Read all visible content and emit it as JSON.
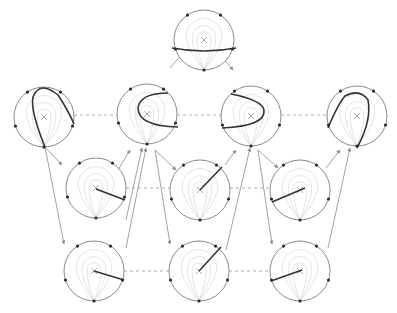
{
  "diagram": {
    "title": "",
    "width": 397,
    "height": 313,
    "colors": {
      "circle": "#8a8a8a",
      "inner": "#d8d8d8",
      "curve": "#333333",
      "dot": "#2a2a2a",
      "arrow": "#8a8a8a",
      "dashed": "#9a9a9a",
      "center": "#9a9a9a"
    },
    "radius": 30,
    "nodes": [
      {
        "id": "top",
        "cx": 204,
        "cy": 40,
        "curve": "M 172 48 Q 204 54 236 48"
      },
      {
        "id": "r1a",
        "cx": 44,
        "cy": 117,
        "curve": "M 45 147 Q 30 110 33 97 Q 40 80 58 95 Q 68 110 74 124"
      },
      {
        "id": "r1b",
        "cx": 147,
        "cy": 114,
        "curve": "M 168 93 Q 140 93 138 108 Q 138 126 178 127"
      },
      {
        "id": "r1c",
        "cx": 251,
        "cy": 116,
        "curve": "M 231 94 Q 262 100 264 110 Q 266 126 222 128"
      },
      {
        "id": "r1d",
        "cx": 357,
        "cy": 116,
        "curve": "M 328 128 Q 338 104 345 96 Q 360 88 368 100 Q 372 120 357 148"
      },
      {
        "id": "r2a",
        "cx": 96,
        "cy": 188,
        "curve": "M 96 189 L 125 200"
      },
      {
        "id": "r2b",
        "cx": 200,
        "cy": 190,
        "curve": "M 200 190 L 222 167"
      },
      {
        "id": "r2c",
        "cx": 300,
        "cy": 190,
        "curve": "M 305 188 L 272 202"
      },
      {
        "id": "r3a",
        "cx": 94,
        "cy": 271,
        "curve": "M 94 271 L 124 280"
      },
      {
        "id": "r3b",
        "cx": 199,
        "cy": 271,
        "curve": "M 199 271 L 221 247"
      },
      {
        "id": "r3c",
        "cx": 300,
        "cy": 271,
        "curve": "M 302 270 L 271 281"
      }
    ],
    "arrows": [
      {
        "from": [
          170,
          68
        ],
        "to": [
          182,
          54
        ]
      },
      {
        "from": [
          223,
          58
        ],
        "to": [
          233,
          70
        ]
      },
      {
        "from": [
          45,
          147
        ],
        "to": [
          62,
          165
        ]
      },
      {
        "from": [
          45,
          147
        ],
        "to": [
          64,
          244
        ]
      },
      {
        "from": [
          118,
          170
        ],
        "to": [
          130,
          150
        ]
      },
      {
        "from": [
          126,
          220
        ],
        "to": [
          142,
          148
        ]
      },
      {
        "from": [
          155,
          150
        ],
        "to": [
          176,
          170
        ]
      },
      {
        "from": [
          155,
          150
        ],
        "to": [
          170,
          244
        ]
      },
      {
        "from": [
          225,
          165
        ],
        "to": [
          236,
          150
        ]
      },
      {
        "from": [
          226,
          250
        ],
        "to": [
          250,
          148
        ]
      },
      {
        "from": [
          258,
          150
        ],
        "to": [
          278,
          168
        ]
      },
      {
        "from": [
          258,
          150
        ],
        "to": [
          272,
          244
        ]
      },
      {
        "from": [
          326,
          168
        ],
        "to": [
          340,
          150
        ]
      },
      {
        "from": [
          328,
          248
        ],
        "to": [
          350,
          148
        ]
      },
      {
        "from": [
          126,
          248
        ],
        "to": [
          146,
          148
        ]
      }
    ],
    "dashed": [
      {
        "from": [
          74,
          115
        ],
        "to": [
          117,
          115
        ]
      },
      {
        "from": [
          177,
          115
        ],
        "to": [
          221,
          115
        ]
      },
      {
        "from": [
          281,
          115
        ],
        "to": [
          327,
          115
        ]
      },
      {
        "from": [
          126,
          188
        ],
        "to": [
          170,
          188
        ]
      },
      {
        "from": [
          230,
          188
        ],
        "to": [
          270,
          188
        ]
      },
      {
        "from": [
          124,
          271
        ],
        "to": [
          169,
          271
        ]
      },
      {
        "from": [
          229,
          271
        ],
        "to": [
          270,
          271
        ]
      }
    ]
  }
}
